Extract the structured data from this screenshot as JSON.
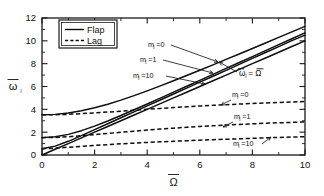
{
  "figure": {
    "background_color": "#ffffff",
    "line_color": "#0d0d0d"
  },
  "legend": {
    "position": "top-left-inside",
    "entries": [
      {
        "label": "Flap",
        "style": "solid"
      },
      {
        "label": "Lag",
        "style": "dashed"
      }
    ]
  },
  "axes": {
    "x": {
      "label": "Ω",
      "label_overbar": true,
      "min": 0,
      "max": 10,
      "major_ticks": [
        0,
        2,
        4,
        6,
        8,
        10
      ],
      "tick_labels": [
        "0",
        "2",
        "4",
        "6",
        "8",
        "10"
      ],
      "minor_tick_step": 1
    },
    "y": {
      "label": "ω",
      "label_subscript": "l",
      "label_overbar": true,
      "min": 0,
      "max": 12,
      "major_ticks": [
        0,
        2,
        4,
        6,
        8,
        10,
        12
      ],
      "tick_labels": [
        "0",
        "2",
        "4",
        "6",
        "8",
        "10",
        "12"
      ],
      "minor_tick_step": 1
    }
  },
  "annotations": [
    {
      "id": "flap-ml-0",
      "text": "m",
      "sub": "l",
      "suffix": "=0",
      "x": 148,
      "y": 47
    },
    {
      "id": "flap-ml-1",
      "text": "m",
      "sub": "l",
      "suffix": "=1",
      "x": 140,
      "y": 62
    },
    {
      "id": "flap-ml-10",
      "text": "m",
      "sub": "l",
      "suffix": "=10",
      "x": 133,
      "y": 78
    },
    {
      "id": "lag-ml-0",
      "text": "m",
      "sub": "l",
      "suffix": "=0",
      "x": 232,
      "y": 97
    },
    {
      "id": "lag-ml-1",
      "text": "m",
      "sub": "l",
      "suffix": "=1",
      "x": 234,
      "y": 119
    },
    {
      "id": "lag-ml-10",
      "text": "m",
      "sub": "l",
      "suffix": "=10",
      "x": 233,
      "y": 146
    },
    {
      "id": "asymptote",
      "text": "ω",
      "sub": "l",
      "suffix": " = Ω",
      "x": 239,
      "y": 76
    }
  ],
  "chart_data": {
    "type": "line",
    "title": "",
    "xlabel": "Ω̄",
    "ylabel": "ω̄_l",
    "xlim": [
      0,
      10
    ],
    "ylim": [
      0,
      12
    ],
    "grid": false,
    "legend_position": "upper left",
    "x": [
      0,
      0.5,
      1,
      1.5,
      2,
      2.5,
      3,
      3.5,
      4,
      4.5,
      5,
      5.5,
      6,
      6.5,
      7,
      7.5,
      8,
      8.5,
      9,
      9.5,
      10
    ],
    "series": [
      {
        "name": "Flap, m_l=0",
        "style": "solid",
        "group": "Flap",
        "m_l": 0,
        "values": [
          3.52,
          3.56,
          3.68,
          3.88,
          4.14,
          4.45,
          4.81,
          5.2,
          5.62,
          6.05,
          6.5,
          6.96,
          7.42,
          7.89,
          8.37,
          8.85,
          9.33,
          9.81,
          10.3,
          10.78,
          11.27
        ]
      },
      {
        "name": "Flap, m_l=1",
        "style": "solid",
        "group": "Flap",
        "m_l": 1,
        "values": [
          1.52,
          1.6,
          1.81,
          2.13,
          2.53,
          2.98,
          3.46,
          3.96,
          4.47,
          4.98,
          5.5,
          6.02,
          6.54,
          7.06,
          7.58,
          8.1,
          8.62,
          9.14,
          9.66,
          10.18,
          10.7
        ]
      },
      {
        "name": "Flap, m_l=10",
        "style": "solid",
        "group": "Flap",
        "m_l": 10,
        "values": [
          0.55,
          0.78,
          1.2,
          1.7,
          2.22,
          2.74,
          3.26,
          3.78,
          4.3,
          4.82,
          5.34,
          5.86,
          6.38,
          6.9,
          7.42,
          7.94,
          8.46,
          8.98,
          9.5,
          10.02,
          10.5
        ]
      },
      {
        "name": "Asymptote omega = Omega",
        "style": "solid",
        "group": "Asymptote",
        "values": [
          0,
          0.5,
          1,
          1.5,
          2,
          2.5,
          3,
          3.5,
          4,
          4.5,
          5,
          5.5,
          6,
          6.5,
          7,
          7.5,
          8,
          8.5,
          9,
          9.5,
          10
        ]
      },
      {
        "name": "Lag, m_l=0",
        "style": "dashed",
        "group": "Lag",
        "m_l": 0,
        "values": [
          3.52,
          3.53,
          3.56,
          3.62,
          3.69,
          3.76,
          3.84,
          3.92,
          4.0,
          4.08,
          4.15,
          4.22,
          4.29,
          4.35,
          4.41,
          4.46,
          4.51,
          4.56,
          4.6,
          4.64,
          4.68
        ]
      },
      {
        "name": "Lag, m_l=1",
        "style": "dashed",
        "group": "Lag",
        "m_l": 1,
        "values": [
          1.52,
          1.54,
          1.6,
          1.69,
          1.79,
          1.89,
          1.99,
          2.09,
          2.18,
          2.27,
          2.35,
          2.43,
          2.5,
          2.56,
          2.62,
          2.68,
          2.73,
          2.78,
          2.82,
          2.86,
          2.9
        ]
      },
      {
        "name": "Lag, m_l=10",
        "style": "dashed",
        "group": "Lag",
        "m_l": 10,
        "values": [
          0.55,
          0.6,
          0.68,
          0.76,
          0.84,
          0.91,
          0.98,
          1.04,
          1.1,
          1.15,
          1.2,
          1.25,
          1.3,
          1.34,
          1.38,
          1.42,
          1.46,
          1.5,
          1.54,
          1.57,
          1.6
        ]
      }
    ]
  }
}
